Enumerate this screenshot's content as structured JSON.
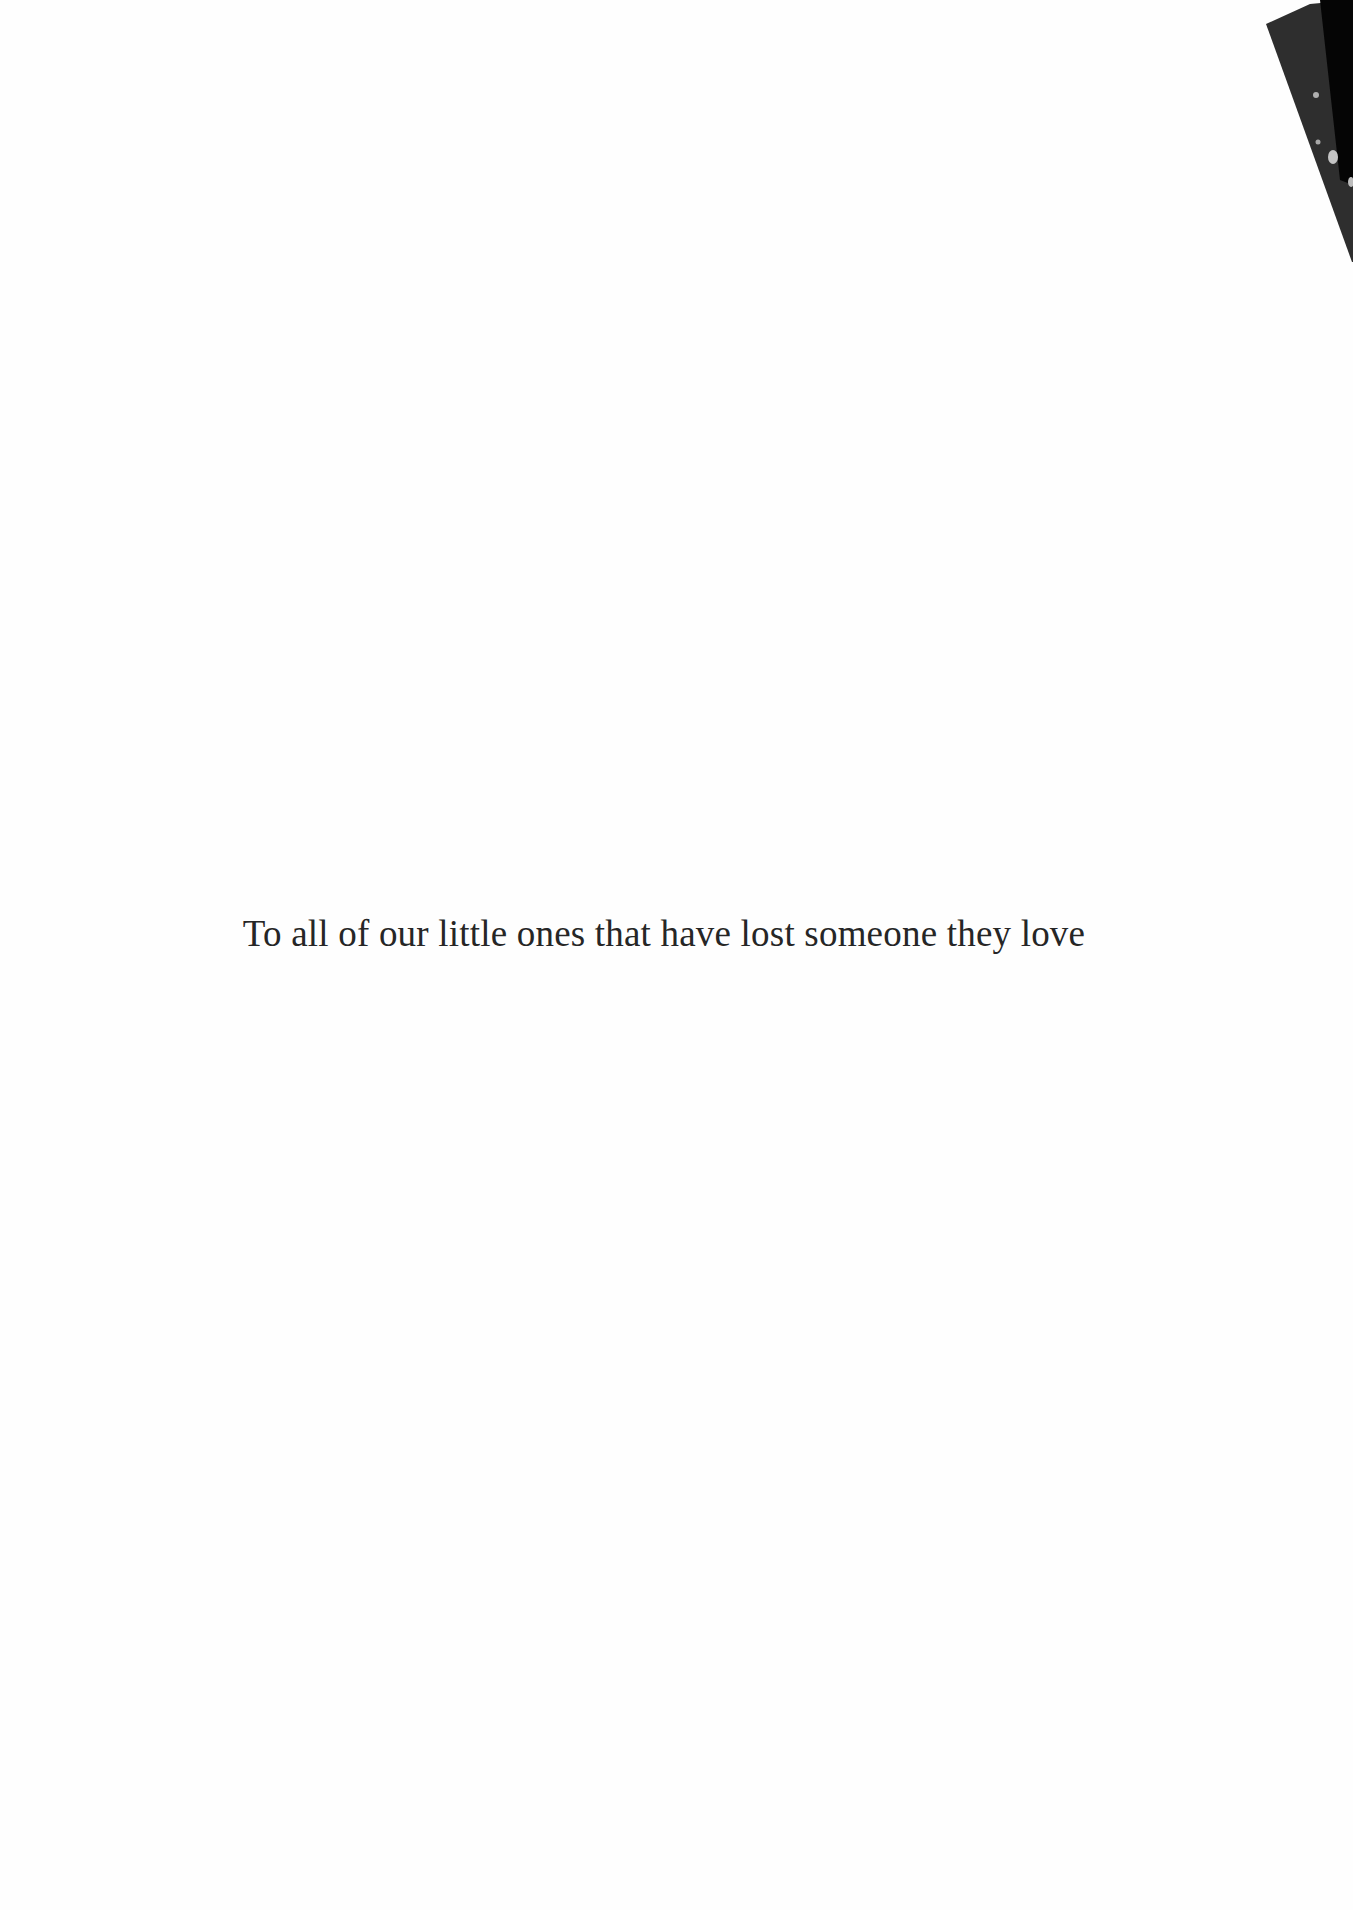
{
  "page": {
    "dedication_text": "To all of our little ones that have lost someone they love"
  },
  "colors": {
    "background": "#fefefe",
    "text": "#262626",
    "corner_dark": "#2e2e2e",
    "corner_black": "#050505",
    "corner_speckle": "#b5b5b5"
  }
}
